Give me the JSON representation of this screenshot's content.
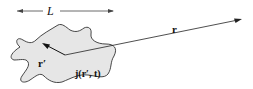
{
  "diagram": {
    "labels": {
      "length": "L",
      "field_point": "r",
      "source_point": "r′",
      "current_density": "j(r′, t)"
    },
    "colors": {
      "region_fill": "#e6e6e6",
      "stroke": "#222222"
    }
  }
}
